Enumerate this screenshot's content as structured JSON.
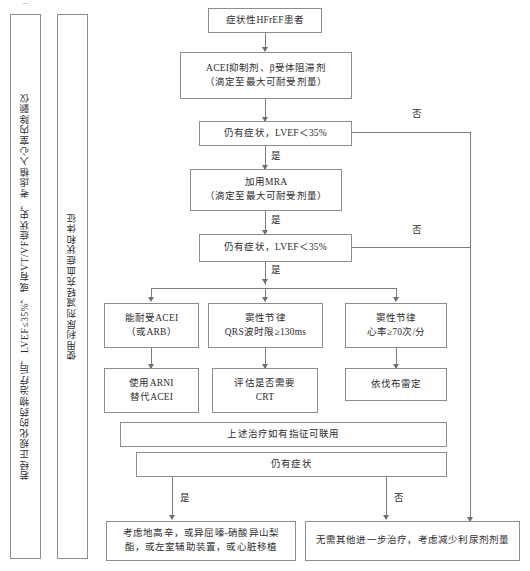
{
  "figure": {
    "type": "clinical-treatment-flowchart",
    "language": "zh-CN",
    "corner_mark": "一"
  },
  "side_panels": [
    {
      "id": "icd-panel",
      "text": "若经正规化的药物治疗后，LVEF≤35%，或有VT/VF症状史，考虑植入心室内除颤仪"
    },
    {
      "id": "diuretic-panel",
      "text": "使用利尿剂减轻充血症状和体征"
    }
  ],
  "nodes": {
    "start": {
      "line1": "症状性HFrEF患者"
    },
    "acei_bb": {
      "line1": "ACEI抑制剂、β受体阻滞剂",
      "line2": "（滴定至最大可耐受剂量）"
    },
    "decision1": {
      "line1": "仍有症状，LVEF＜35%"
    },
    "mra": {
      "line1": "加用MRA",
      "line2": "（滴定至最大可耐受剂量）"
    },
    "decision2": {
      "line1": "仍有症状，LVEF＜35%"
    },
    "branch_a1": {
      "line1": "能耐受ACEI",
      "line2": "（或ARB）"
    },
    "branch_b1": {
      "line1": "窦性节律",
      "line2": "QRS波时限≥130ms"
    },
    "branch_c1": {
      "line1": "窦性节律",
      "line2": "心率≥70次/分"
    },
    "branch_a2": {
      "line1": "使用ARNI",
      "line2": "替代ACEI"
    },
    "branch_b2": {
      "line1": "评估是否需要",
      "line2": "CRT"
    },
    "branch_c2": {
      "line1": "依伐布雷定"
    },
    "combine": {
      "line1": "上述治疗如有指征可联用"
    },
    "decision3": {
      "line1": "仍有症状"
    },
    "outcome_yes": {
      "line1": "考虑地高辛，或异屈嗪-硝酸异山梨",
      "line2": "酯，或左室辅助装置，或心脏移植"
    },
    "outcome_no": {
      "line1": "无需其他进一步治疗，考虑减少利尿剂剂量"
    }
  },
  "edge_labels": {
    "yes1": "是",
    "no1": "否",
    "yes2": "是",
    "no2": "否",
    "yes3": "是",
    "yes_bottom": "是",
    "no_bottom": "否"
  },
  "colors": {
    "box_border": "#8d8d8d",
    "connector": "#7c7c7c",
    "text": "#2d2d2d",
    "background": "#ffffff"
  }
}
